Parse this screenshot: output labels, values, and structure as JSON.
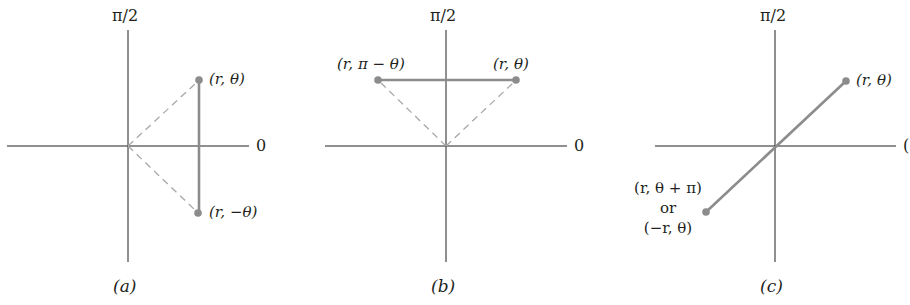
{
  "figure": {
    "colors": {
      "axis": "#231f20",
      "segment": "#8c8c8c",
      "dashed": "#a8a8a8",
      "point": "#8c8c8c",
      "text": "#231f20"
    },
    "panels": [
      {
        "id": "a",
        "caption": "(a)",
        "axis_top_label": "π/2",
        "axis_right_label": "0",
        "symmetry": "about the polar axis",
        "points": [
          {
            "label": "(r, θ)"
          },
          {
            "label": "(r, −θ)"
          }
        ]
      },
      {
        "id": "b",
        "caption": "(b)",
        "axis_top_label": "π/2",
        "axis_right_label": "0",
        "symmetry": "about the line θ = π/2",
        "points": [
          {
            "label": "(r, π − θ)"
          },
          {
            "label": "(r, θ)"
          }
        ]
      },
      {
        "id": "c",
        "caption": "(c)",
        "axis_top_label": "π/2",
        "axis_right_label": "(",
        "symmetry": "about the pole",
        "points": [
          {
            "label": "(r, θ)"
          },
          {
            "label_line1": "(r, θ + π)",
            "label_line2": "or",
            "label_line3": "(−r, θ)"
          }
        ]
      }
    ]
  }
}
